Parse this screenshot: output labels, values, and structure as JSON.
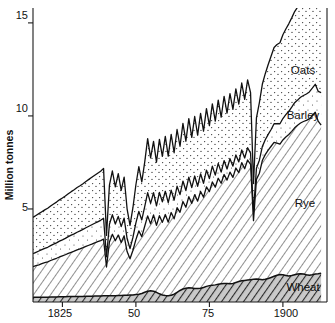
{
  "chart_data": {
    "type": "area",
    "stacked": true,
    "title": "",
    "subtitle": "",
    "xlabel": "",
    "ylabel": "Million tonnes",
    "xlim": [
      1815,
      1915
    ],
    "ylim": [
      0,
      15.8
    ],
    "grid": false,
    "legend_position": "inline-right",
    "y_ticks": [
      5,
      10,
      15
    ],
    "y_tick_labels": [
      "5",
      "10",
      "15"
    ],
    "x_ticks": [
      1825,
      1850,
      1875,
      1900
    ],
    "x_tick_labels": [
      "1825",
      "50",
      "75",
      "1900"
    ],
    "series_order_bottom_to_top": [
      "Wheat",
      "Rye",
      "Barley",
      "Oats"
    ],
    "x": [
      1815,
      1816,
      1817,
      1818,
      1819,
      1820,
      1821,
      1822,
      1823,
      1824,
      1825,
      1826,
      1827,
      1828,
      1829,
      1830,
      1831,
      1832,
      1833,
      1834,
      1835,
      1836,
      1837,
      1838,
      1839,
      1840,
      1841,
      1842,
      1843,
      1844,
      1845,
      1846,
      1847,
      1848,
      1849,
      1850,
      1851,
      1852,
      1853,
      1854,
      1855,
      1856,
      1857,
      1858,
      1859,
      1860,
      1861,
      1862,
      1863,
      1864,
      1865,
      1866,
      1867,
      1868,
      1869,
      1870,
      1871,
      1872,
      1873,
      1874,
      1875,
      1876,
      1877,
      1878,
      1879,
      1880,
      1881,
      1882,
      1883,
      1884,
      1885,
      1886,
      1887,
      1888,
      1889,
      1890,
      1891,
      1892,
      1893,
      1894,
      1895,
      1896,
      1897,
      1898,
      1899,
      1900,
      1901,
      1902,
      1903,
      1904,
      1905,
      1906,
      1907,
      1908,
      1909,
      1910,
      1911,
      1912,
      1913
    ],
    "series": [
      {
        "name": "Wheat",
        "pattern": "dense-diagonal-hatch",
        "label": "Wheat",
        "values": [
          0.25,
          0.25,
          0.25,
          0.26,
          0.26,
          0.26,
          0.27,
          0.27,
          0.27,
          0.28,
          0.28,
          0.28,
          0.29,
          0.29,
          0.29,
          0.3,
          0.3,
          0.3,
          0.31,
          0.31,
          0.31,
          0.32,
          0.32,
          0.32,
          0.33,
          0.33,
          0.33,
          0.34,
          0.34,
          0.35,
          0.35,
          0.36,
          0.36,
          0.37,
          0.38,
          0.4,
          0.42,
          0.46,
          0.52,
          0.58,
          0.6,
          0.58,
          0.52,
          0.44,
          0.38,
          0.35,
          0.34,
          0.36,
          0.42,
          0.52,
          0.62,
          0.7,
          0.74,
          0.76,
          0.75,
          0.72,
          0.72,
          0.74,
          0.78,
          0.84,
          0.88,
          0.9,
          0.92,
          0.95,
          0.98,
          1.0,
          1.0,
          0.98,
          1.0,
          1.05,
          1.1,
          1.14,
          1.16,
          1.18,
          1.2,
          1.22,
          1.24,
          1.22,
          1.2,
          1.22,
          1.26,
          1.32,
          1.38,
          1.44,
          1.48,
          1.46,
          1.42,
          1.4,
          1.42,
          1.46,
          1.5,
          1.52,
          1.5,
          1.46,
          1.44,
          1.46,
          1.5,
          1.52,
          1.55
        ]
      },
      {
        "name": "Rye",
        "pattern": "diagonal-hatch",
        "label": "Rye",
        "values": [
          1.65,
          1.7,
          1.75,
          1.8,
          1.85,
          1.9,
          1.96,
          2.02,
          2.08,
          2.14,
          2.2,
          2.26,
          2.32,
          2.38,
          2.44,
          2.5,
          2.56,
          2.62,
          2.68,
          2.74,
          2.8,
          2.86,
          2.92,
          2.98,
          3.05,
          1.55,
          2.9,
          3.3,
          2.95,
          3.25,
          2.85,
          3.2,
          2.35,
          1.95,
          2.4,
          2.95,
          3.4,
          3.05,
          3.55,
          4.05,
          3.6,
          4.1,
          3.6,
          4.2,
          3.9,
          4.35,
          3.95,
          4.45,
          4.05,
          4.55,
          4.2,
          4.7,
          4.35,
          4.9,
          4.55,
          5.05,
          4.7,
          5.2,
          4.85,
          5.35,
          5.05,
          5.55,
          5.25,
          5.7,
          5.4,
          5.85,
          5.55,
          6.0,
          5.7,
          6.15,
          5.85,
          6.35,
          6.0,
          6.45,
          6.2,
          3.15,
          5.35,
          5.7,
          6.4,
          6.7,
          6.9,
          7.05,
          7.2,
          7.1,
          7.0,
          7.25,
          7.45,
          7.6,
          7.75,
          7.9,
          8.0,
          8.1,
          8.2,
          8.3,
          8.4,
          8.55,
          8.7,
          8.2,
          7.95
        ]
      },
      {
        "name": "Barley",
        "pattern": "light-stipple",
        "label": "Barley",
        "values": [
          0.7,
          0.72,
          0.74,
          0.75,
          0.77,
          0.78,
          0.8,
          0.82,
          0.83,
          0.85,
          0.86,
          0.88,
          0.9,
          0.92,
          0.93,
          0.95,
          0.96,
          0.98,
          1.0,
          1.02,
          1.04,
          1.05,
          1.07,
          1.09,
          1.12,
          0.55,
          0.95,
          1.05,
          0.9,
          1.0,
          0.85,
          0.95,
          0.7,
          0.55,
          0.7,
          0.9,
          1.05,
          0.9,
          1.05,
          1.25,
          1.1,
          1.2,
          1.05,
          1.25,
          1.1,
          1.25,
          1.05,
          1.2,
          1.0,
          1.15,
          0.95,
          1.1,
          0.9,
          1.05,
          0.85,
          1.0,
          0.8,
          0.95,
          0.75,
          0.9,
          0.7,
          0.85,
          0.65,
          0.8,
          0.6,
          0.75,
          0.6,
          0.72,
          0.6,
          0.7,
          0.58,
          0.68,
          0.58,
          0.66,
          0.6,
          0.45,
          0.6,
          0.7,
          0.75,
          0.8,
          0.85,
          0.9,
          1.0,
          1.05,
          1.1,
          1.15,
          1.2,
          1.25,
          1.3,
          1.35,
          1.35,
          1.38,
          1.4,
          1.42,
          1.45,
          1.48,
          1.5,
          1.6,
          1.75
        ]
      },
      {
        "name": "Oats",
        "pattern": "stipple",
        "label": "Oats",
        "values": [
          1.95,
          1.98,
          2.01,
          2.04,
          2.07,
          2.1,
          2.13,
          2.16,
          2.19,
          2.22,
          2.25,
          2.28,
          2.31,
          2.34,
          2.37,
          2.4,
          2.43,
          2.46,
          2.49,
          2.52,
          2.55,
          2.58,
          2.61,
          2.64,
          2.68,
          1.15,
          2.1,
          2.35,
          2.0,
          2.3,
          1.95,
          2.2,
          1.6,
          1.25,
          1.6,
          2.05,
          2.4,
          2.05,
          2.4,
          2.9,
          2.45,
          2.75,
          2.35,
          2.85,
          2.45,
          2.95,
          2.5,
          3.0,
          2.55,
          3.05,
          2.6,
          3.1,
          2.65,
          3.15,
          2.7,
          3.2,
          2.75,
          3.25,
          2.8,
          3.3,
          2.85,
          3.35,
          2.9,
          3.4,
          2.95,
          3.45,
          3.0,
          3.5,
          3.05,
          3.55,
          3.1,
          3.6,
          3.15,
          3.65,
          3.25,
          1.55,
          2.7,
          3.1,
          3.35,
          3.55,
          3.75,
          3.95,
          4.1,
          4.25,
          4.35,
          4.5,
          4.6,
          4.7,
          4.8,
          4.9,
          5.0,
          5.1,
          5.2,
          5.3,
          5.4,
          5.55,
          5.7,
          5.85,
          6.1
        ]
      }
    ]
  },
  "chart": {
    "y_axis_title": "Million tonnes",
    "y_tick_1": "5",
    "y_tick_2": "10",
    "y_tick_3": "15",
    "x_tick_1": "1825",
    "x_tick_2": "50",
    "x_tick_3": "75",
    "x_tick_4": "1900",
    "label_oats": "Oats",
    "label_barley": "Barley",
    "label_rye": "Rye",
    "label_wheat": "Wheat"
  },
  "colors": {
    "ink": "#111111",
    "paper": "#ffffff",
    "wheat_fill": "#b8b8b8",
    "rye_fill": "#d8d8d8",
    "barley_fill": "#f4f4f4",
    "oats_fill": "#fafafa"
  }
}
